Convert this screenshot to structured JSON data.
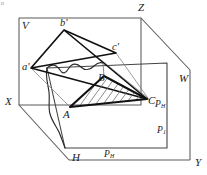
{
  "figure": {
    "kind": "descriptive-geometry-diagram",
    "corner_mark": "n",
    "stroke_color": "#1a1a1a",
    "box_color": "#555555",
    "hatch_color": "#6b6b6b",
    "background": "#ffffff"
  },
  "labels": {
    "plane_v": "V",
    "plane_h": "H",
    "plane_w": "W",
    "axis_x": "X",
    "axis_y": "Y",
    "axis_z": "Z",
    "trace_ph_right": {
      "base": "P",
      "sub": "H"
    },
    "trace_p1": {
      "base": "P",
      "sub": "1"
    },
    "trace_ph_bottom": {
      "base": "P",
      "sub": "H"
    },
    "vertex_a_prime": "a'",
    "vertex_b_prime": "b'",
    "vertex_c_prime": "c'",
    "vertex_a": "A",
    "vertex_b": "B",
    "vertex_c": "C"
  },
  "geometry": {
    "projection_triangle": [
      "a'",
      "b'",
      "c'"
    ],
    "object_triangle": [
      "A",
      "B",
      "C"
    ],
    "hatched": "triangle-ABC",
    "planes": [
      "V",
      "H",
      "W",
      "P"
    ]
  }
}
